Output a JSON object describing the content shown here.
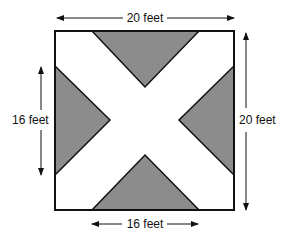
{
  "diagram": {
    "colors": {
      "outline": "#111111",
      "shaded": "#8c8c8c",
      "background": "#ffffff"
    },
    "labels": {
      "top_width": "20 feet",
      "right_height": "20 feet",
      "left_triangle_base": "16 feet",
      "bottom_triangle_base": "16 feet"
    },
    "shapes": {
      "square": {
        "side_ft": 20
      },
      "triangles": [
        {
          "position": "top",
          "base_ft": 16
        },
        {
          "position": "left",
          "base_ft": 16
        },
        {
          "position": "right",
          "base_ft": 16
        },
        {
          "position": "bottom",
          "base_ft": 16
        }
      ]
    }
  }
}
